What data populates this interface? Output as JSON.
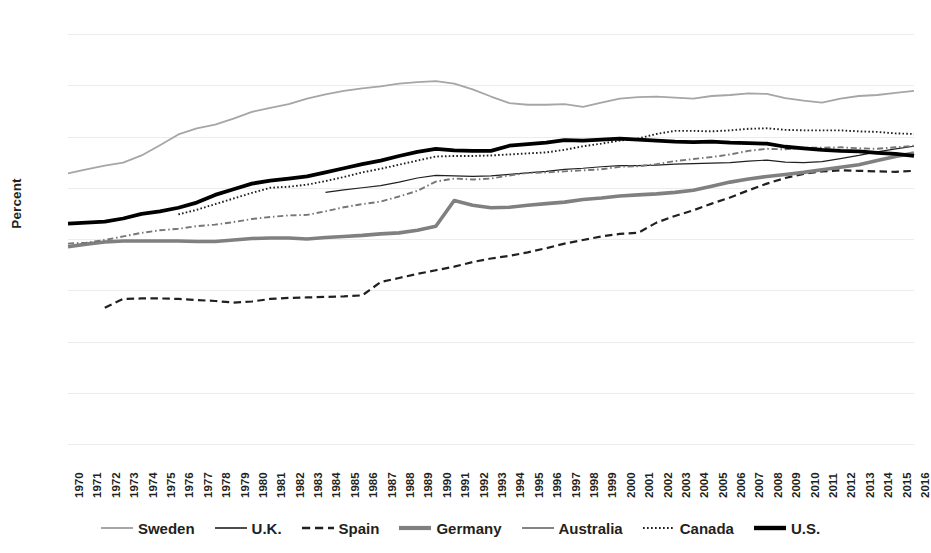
{
  "chart_data": {
    "type": "line",
    "title": "",
    "xlabel": "",
    "ylabel": "Percent",
    "ylim": [
      0,
      80
    ],
    "ytick_step": 10,
    "yticks": [
      80,
      70,
      60,
      50,
      40,
      30,
      20,
      10,
      0
    ],
    "grid": true,
    "legend_position": "bottom",
    "x": [
      1970,
      1971,
      1972,
      1973,
      1974,
      1975,
      1976,
      1977,
      1978,
      1979,
      1980,
      1981,
      1982,
      1983,
      1984,
      1985,
      1986,
      1987,
      1988,
      1989,
      1990,
      1991,
      1992,
      1993,
      1994,
      1995,
      1996,
      1997,
      1998,
      1999,
      2000,
      2001,
      2002,
      2003,
      2004,
      2005,
      2006,
      2007,
      2008,
      2009,
      2010,
      2011,
      2012,
      2013,
      2014,
      2015,
      2016
    ],
    "series": [
      {
        "name": "Sweden",
        "style": "solid",
        "color": "#a6a6a6",
        "width": 1.8,
        "values": [
          52.8,
          53.6,
          54.3,
          54.9,
          56.3,
          58.3,
          60.4,
          61.6,
          62.3,
          63.5,
          64.8,
          65.6,
          66.3,
          67.4,
          68.2,
          68.9,
          69.4,
          69.8,
          70.3,
          70.6,
          70.8,
          70.3,
          69.2,
          67.8,
          66.5,
          66.2,
          66.2,
          66.3,
          65.8,
          66.6,
          67.4,
          67.7,
          67.8,
          67.6,
          67.4,
          67.9,
          68.1,
          68.4,
          68.3,
          67.5,
          67.0,
          66.6,
          67.4,
          67.9,
          68.1,
          68.5,
          68.9
        ]
      },
      {
        "name": "U.K.",
        "style": "solid",
        "color": "#231f20",
        "width": 1.2,
        "values": [
          null,
          null,
          null,
          null,
          null,
          null,
          null,
          null,
          null,
          null,
          null,
          null,
          null,
          null,
          49.1,
          49.6,
          50.0,
          50.4,
          51.1,
          51.9,
          52.4,
          52.3,
          52.2,
          52.3,
          52.6,
          52.9,
          53.2,
          53.6,
          53.8,
          54.1,
          54.3,
          54.3,
          54.4,
          54.6,
          54.7,
          54.8,
          54.9,
          55.2,
          55.4,
          55.0,
          54.9,
          55.1,
          55.7,
          56.3,
          57.0,
          57.6,
          58.1
        ]
      },
      {
        "name": "Spain",
        "style": "dashed",
        "color": "#231f20",
        "width": 2.2,
        "values": [
          null,
          null,
          26.6,
          28.3,
          28.4,
          28.4,
          28.3,
          28.1,
          27.9,
          27.6,
          27.8,
          28.3,
          28.5,
          28.6,
          28.7,
          28.8,
          29.0,
          31.6,
          32.4,
          33.2,
          33.9,
          34.6,
          35.5,
          36.2,
          36.7,
          37.4,
          38.2,
          39.1,
          39.8,
          40.5,
          41.0,
          41.2,
          43.2,
          44.5,
          45.6,
          46.9,
          48.1,
          49.5,
          50.8,
          51.9,
          52.7,
          53.2,
          53.4,
          53.3,
          53.2,
          53.1,
          53.3
        ]
      },
      {
        "name": "Germany",
        "style": "solid",
        "color": "#808080",
        "width": 3.6,
        "values": [
          38.5,
          39.0,
          39.4,
          39.6,
          39.6,
          39.6,
          39.6,
          39.5,
          39.5,
          39.8,
          40.1,
          40.2,
          40.2,
          40.0,
          40.3,
          40.5,
          40.7,
          41.0,
          41.2,
          41.7,
          42.5,
          47.5,
          46.6,
          46.1,
          46.2,
          46.6,
          46.9,
          47.2,
          47.7,
          48.0,
          48.4,
          48.6,
          48.8,
          49.1,
          49.5,
          50.3,
          51.1,
          51.7,
          52.2,
          52.6,
          53.0,
          53.5,
          54.0,
          54.5,
          55.3,
          56.1,
          56.8
        ]
      },
      {
        "name": "Australia",
        "style": "dashdot",
        "color": "#767676",
        "width": 1.9,
        "values": [
          39.1,
          39.3,
          39.8,
          40.5,
          41.2,
          41.7,
          42.0,
          42.5,
          42.8,
          43.3,
          43.9,
          44.3,
          44.6,
          44.7,
          45.4,
          46.2,
          46.8,
          47.3,
          48.3,
          49.4,
          51.2,
          51.8,
          51.6,
          51.8,
          52.4,
          52.9,
          53.0,
          53.2,
          53.4,
          53.6,
          54.1,
          54.2,
          54.6,
          55.2,
          55.6,
          56.0,
          56.5,
          57.2,
          57.6,
          57.5,
          57.8,
          57.8,
          57.9,
          57.7,
          57.6,
          57.9,
          58.2
        ]
      },
      {
        "name": "Canada",
        "style": "dotted",
        "color": "#231f20",
        "width": 1.9,
        "values": [
          null,
          null,
          null,
          null,
          null,
          null,
          44.8,
          45.7,
          46.8,
          47.9,
          49.0,
          50.0,
          50.2,
          50.6,
          51.3,
          52.1,
          53.0,
          53.7,
          54.5,
          55.3,
          56.1,
          56.2,
          56.2,
          56.3,
          56.5,
          56.7,
          56.9,
          57.4,
          58.1,
          58.6,
          59.2,
          59.6,
          60.5,
          61.1,
          61.1,
          61.0,
          61.2,
          61.5,
          61.6,
          61.3,
          61.2,
          61.2,
          61.2,
          61.0,
          60.9,
          60.6,
          60.5
        ]
      },
      {
        "name": "U.S.",
        "style": "solid",
        "color": "#000000",
        "width": 3.8,
        "values": [
          43.0,
          43.2,
          43.4,
          44.0,
          44.9,
          45.4,
          46.1,
          47.1,
          48.6,
          49.7,
          50.8,
          51.4,
          51.8,
          52.2,
          53.0,
          53.8,
          54.6,
          55.3,
          56.2,
          57.0,
          57.6,
          57.3,
          57.2,
          57.2,
          58.2,
          58.5,
          58.8,
          59.3,
          59.2,
          59.4,
          59.6,
          59.4,
          59.2,
          59.0,
          58.9,
          59.0,
          58.8,
          58.7,
          58.6,
          58.0,
          57.7,
          57.4,
          57.2,
          57.1,
          56.8,
          56.6,
          56.2
        ]
      }
    ]
  },
  "y_axis": {
    "title": "Percent",
    "ticks": [
      "80",
      "70",
      "60",
      "50",
      "40",
      "30",
      "20",
      "10",
      "0"
    ]
  },
  "x_axis": {
    "ticks": [
      "1970",
      "1971",
      "1972",
      "1973",
      "1974",
      "1975",
      "1976",
      "1977",
      "1978",
      "1979",
      "1980",
      "1981",
      "1982",
      "1983",
      "1984",
      "1985",
      "1986",
      "1987",
      "1988",
      "1989",
      "1990",
      "1991",
      "1992",
      "1993",
      "1994",
      "1995",
      "1996",
      "1997",
      "1998",
      "1999",
      "2000",
      "2001",
      "2002",
      "2003",
      "2004",
      "2005",
      "2006",
      "2007",
      "2008",
      "2009",
      "2010",
      "2011",
      "2012",
      "2013",
      "2014",
      "2015",
      "2016"
    ]
  },
  "legend": {
    "items": [
      {
        "label": "Sweden",
        "color": "#a6a6a6",
        "style": "solid",
        "width": 2.0
      },
      {
        "label": "U.K.",
        "color": "#231f20",
        "style": "solid",
        "width": 1.6
      },
      {
        "label": "Spain",
        "color": "#231f20",
        "style": "dashed",
        "width": 2.4
      },
      {
        "label": "Germany",
        "color": "#808080",
        "style": "solid",
        "width": 4.2
      },
      {
        "label": "Australia",
        "color": "#767676",
        "style": "solid",
        "width": 1.8
      },
      {
        "label": "Canada",
        "color": "#231f20",
        "style": "dotted",
        "width": 2.0
      },
      {
        "label": "U.S.",
        "color": "#000000",
        "style": "solid",
        "width": 4.4
      }
    ]
  },
  "colors": {
    "background": "#ffffff",
    "gridline": "#ececec",
    "text": "#231f20"
  }
}
